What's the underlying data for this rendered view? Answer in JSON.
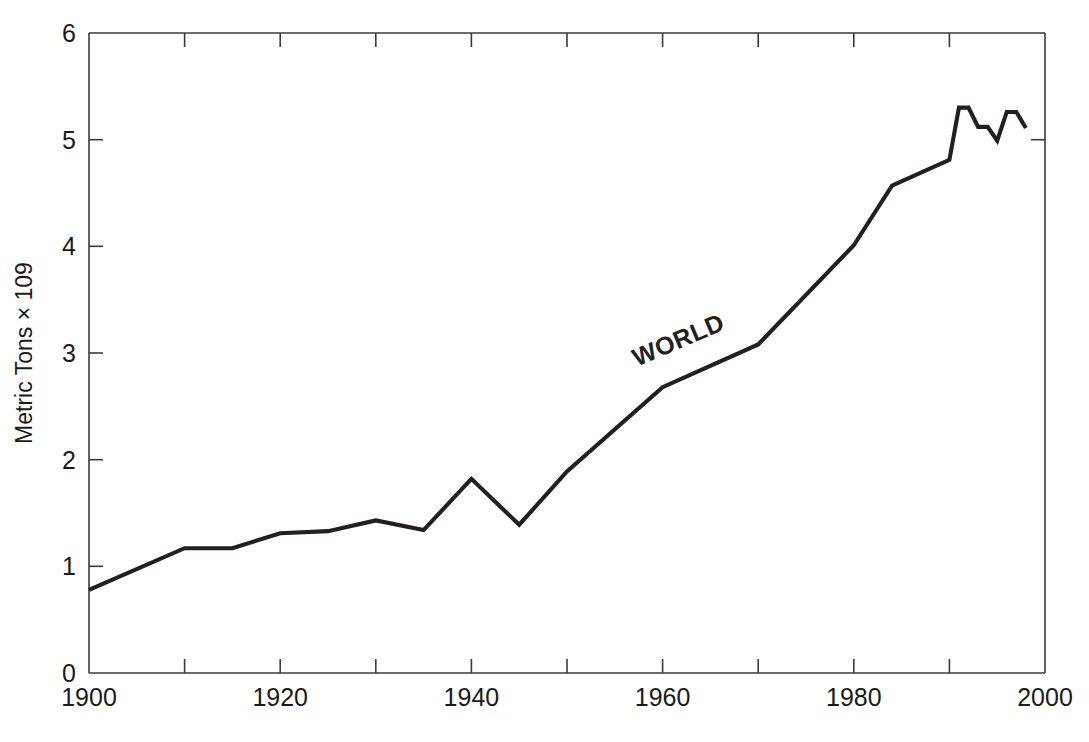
{
  "figure": {
    "background_color": "#ffffff",
    "line_color": "#231f20",
    "axis_color": "#3a3a3a",
    "series_label": "WORLD",
    "caption_fragment": ""
  },
  "axes": {
    "y_title": "Metric Tons × 109",
    "x_tick_labels": [
      "1900",
      "1920",
      "1940",
      "1960",
      "1980",
      "2000"
    ],
    "y_tick_labels": [
      "0",
      "1",
      "2",
      "3",
      "4",
      "5",
      "6"
    ]
  },
  "chart_data": {
    "type": "line",
    "title": "",
    "xlabel": "",
    "ylabel": "Metric Tons × 109",
    "xlim": [
      1900,
      2000
    ],
    "ylim": [
      0,
      6
    ],
    "xticks": [
      1900,
      1920,
      1940,
      1960,
      1980,
      2000
    ],
    "xminorticks": [
      1910,
      1930,
      1950,
      1970,
      1990
    ],
    "yticks": [
      0,
      1,
      2,
      3,
      4,
      5,
      6
    ],
    "grid": false,
    "legend": "none",
    "annotations": [
      {
        "text": "WORLD",
        "x": 1962,
        "y": 3.05,
        "rotation": -23,
        "bold": true
      }
    ],
    "series": [
      {
        "name": "WORLD",
        "x": [
          1900,
          1910,
          1915,
          1920,
          1925,
          1930,
          1935,
          1940,
          1945,
          1950,
          1960,
          1970,
          1980,
          1984,
          1990,
          1991,
          1992,
          1993,
          1994,
          1995,
          1996,
          1997,
          1998
        ],
        "values": [
          0.78,
          1.17,
          1.17,
          1.31,
          1.33,
          1.43,
          1.34,
          1.82,
          1.39,
          1.89,
          2.68,
          3.08,
          4.01,
          4.57,
          4.81,
          5.3,
          5.3,
          5.12,
          5.12,
          4.99,
          5.26,
          5.26,
          5.11
        ],
        "color": "#231f20"
      }
    ]
  }
}
